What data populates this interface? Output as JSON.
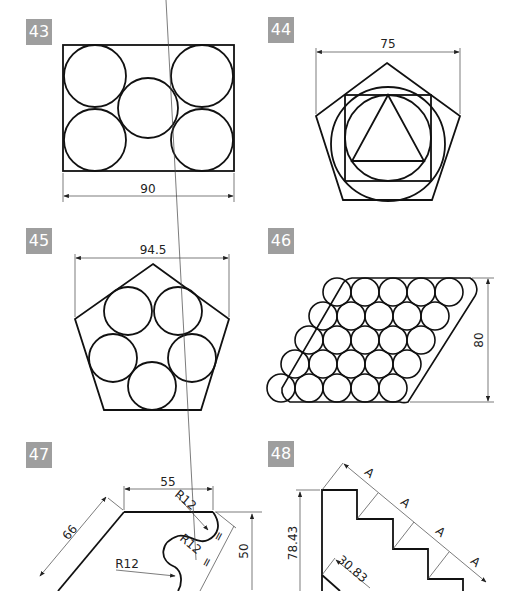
{
  "exercises": [
    {
      "number": "43",
      "dimensions": {
        "width": "90"
      }
    },
    {
      "number": "44",
      "dimensions": {
        "width": "75"
      }
    },
    {
      "number": "45",
      "dimensions": {
        "width": "94.5"
      }
    },
    {
      "number": "46",
      "dimensions": {
        "height": "80"
      }
    },
    {
      "number": "47",
      "dimensions": {
        "top": "55",
        "slant": "66",
        "radius_1": "R12",
        "radius_2": "R12",
        "radius_3": "R12",
        "height": "50",
        "equal": "="
      }
    },
    {
      "number": "48",
      "dimensions": {
        "height": "78.43",
        "diag": "30.83",
        "step": "A"
      }
    }
  ]
}
